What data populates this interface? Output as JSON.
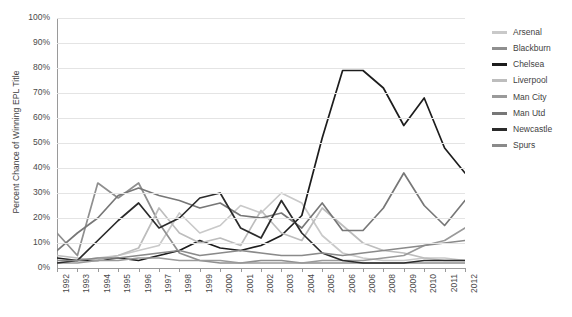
{
  "chart_data": {
    "type": "line",
    "title": "",
    "xlabel": "",
    "ylabel": "Percent Chance of Winning EPL Title",
    "ylim": [
      0,
      100
    ],
    "xlim": [
      1992,
      2012
    ],
    "grid": true,
    "legend_position": "right",
    "y_ticks": [
      "0%",
      "10%",
      "20%",
      "30%",
      "40%",
      "50%",
      "60%",
      "70%",
      "80%",
      "90%",
      "100%"
    ],
    "y_tick_values": [
      0,
      10,
      20,
      30,
      40,
      50,
      60,
      70,
      80,
      90,
      100
    ],
    "x_tick_labels": [
      "1992",
      "1993",
      "1994",
      "1995",
      "1996",
      "1997",
      "1998",
      "1999",
      "2000",
      "2001",
      "2002",
      "2003",
      "2004",
      "2005",
      "2006",
      "2006",
      "2008",
      "2009",
      "2010",
      "2011",
      "2012"
    ],
    "x": [
      1992,
      1993,
      1994,
      1995,
      1996,
      1997,
      1998,
      1999,
      2000,
      2001,
      2002,
      2003,
      2004,
      2005,
      2006,
      2007,
      2008,
      2009,
      2010,
      2011,
      2012
    ],
    "series": [
      {
        "name": "Arsenal",
        "color": "#c9c9c9",
        "values": [
          2,
          3,
          4,
          5,
          7,
          9,
          22,
          14,
          17,
          25,
          22,
          30,
          26,
          13,
          6,
          4,
          3,
          3,
          4,
          4,
          3
        ]
      },
      {
        "name": "Blackburn",
        "color": "#8f8f8f",
        "values": [
          14,
          5,
          34,
          28,
          34,
          18,
          6,
          3,
          2,
          2,
          3,
          3,
          2,
          2,
          2,
          2,
          2,
          2,
          2,
          2,
          2
        ]
      },
      {
        "name": "Chelsea",
        "color": "#1d1d1d",
        "values": [
          4,
          3,
          3,
          4,
          3,
          5,
          7,
          11,
          8,
          7,
          9,
          13,
          21,
          52,
          79,
          79,
          72,
          57,
          68,
          48,
          38
        ]
      },
      {
        "name": "Liverpool",
        "color": "#bdbdbd",
        "values": [
          5,
          4,
          3,
          5,
          8,
          24,
          14,
          10,
          12,
          9,
          23,
          14,
          11,
          24,
          17,
          10,
          7,
          6,
          4,
          3,
          3
        ]
      },
      {
        "name": "Man City",
        "color": "#9a9a9a",
        "values": [
          2,
          2,
          3,
          3,
          4,
          4,
          3,
          3,
          3,
          2,
          2,
          2,
          2,
          3,
          3,
          3,
          4,
          5,
          9,
          11,
          16
        ]
      },
      {
        "name": "Man Utd",
        "color": "#777777",
        "values": [
          7,
          14,
          20,
          29,
          32,
          29,
          27,
          24,
          26,
          21,
          20,
          22,
          16,
          26,
          15,
          15,
          24,
          38,
          25,
          17,
          27
        ]
      },
      {
        "name": "Newcastle",
        "color": "#2b2b2b",
        "values": [
          2,
          3,
          11,
          19,
          26,
          16,
          20,
          28,
          30,
          16,
          12,
          27,
          14,
          6,
          3,
          2,
          2,
          2,
          3,
          3,
          3
        ]
      },
      {
        "name": "Spurs",
        "color": "#8a8a8a",
        "values": [
          3,
          3,
          4,
          4,
          5,
          6,
          7,
          5,
          6,
          7,
          6,
          5,
          5,
          6,
          5,
          6,
          7,
          8,
          9,
          10,
          11
        ]
      }
    ]
  }
}
